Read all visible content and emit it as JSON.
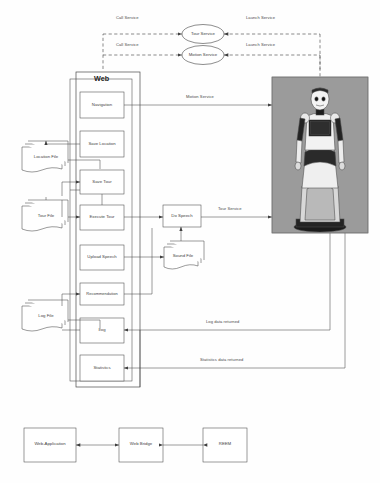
{
  "diagram": {
    "services": [
      {
        "id": "tour-service",
        "label": "Tour Service",
        "shape": "ellipse"
      },
      {
        "id": "motion-service",
        "label": "Motion Service",
        "shape": "ellipse"
      }
    ],
    "dashed_labels": {
      "call_service_top": "Call Service",
      "launch_service_top": "Launch Service",
      "call_service_bottom": "Call Service",
      "launch_service_bottom": "Launch Service"
    },
    "web_container": {
      "label": "Web"
    },
    "web_modules": [
      {
        "id": "navigation",
        "label": "Navigation"
      },
      {
        "id": "save-location",
        "label": "Save Location"
      },
      {
        "id": "save-tour",
        "label": "Save Tour"
      },
      {
        "id": "execute-tour",
        "label": "Execute Tour"
      },
      {
        "id": "upload-speech",
        "label": "Upload Speech"
      },
      {
        "id": "recommendation",
        "label": "Recommendation"
      },
      {
        "id": "log",
        "label": "Log"
      },
      {
        "id": "statistics",
        "label": "Statistics"
      }
    ],
    "process_nodes": [
      {
        "id": "do-speech",
        "label": "Do Speech"
      }
    ],
    "files": [
      {
        "id": "location-file",
        "label": "Location File"
      },
      {
        "id": "tour-file",
        "label": "Tour File"
      },
      {
        "id": "log-file",
        "label": "Log File"
      },
      {
        "id": "sound-file",
        "label": "Sound File"
      }
    ],
    "flow_labels": {
      "motion_service": "Motion Service",
      "tour_service": "Tour Service",
      "log_data_returned": "Log data returned",
      "statistics_data_returned": "Statistics data returned"
    },
    "robot_photo": {
      "caption": "REEM humanoid service robot"
    },
    "bottom_row": [
      {
        "id": "web-application",
        "label": "Web-Application"
      },
      {
        "id": "web-bridge",
        "label": "Web Bridge"
      },
      {
        "id": "reem",
        "label": "REEM"
      }
    ],
    "colors": {
      "stroke": "#4a4a4a",
      "dashed_stroke": "#3d3d3d",
      "text": "#3f3f3f",
      "photo_bg": "#9a9a9a",
      "page_bg": "#ffffff"
    }
  }
}
